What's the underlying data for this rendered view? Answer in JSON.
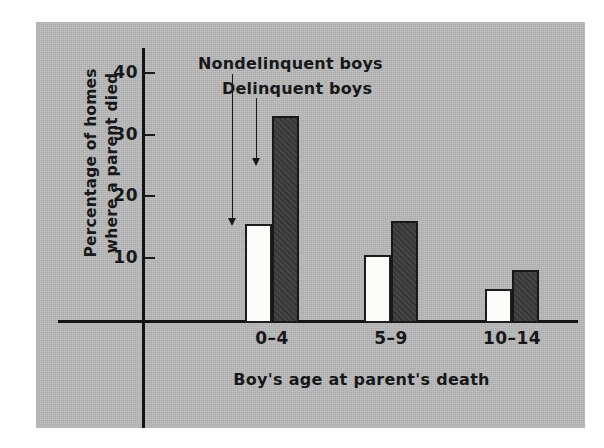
{
  "chart_data": {
    "type": "bar",
    "title": "",
    "xlabel": "Boy's age at parent's death",
    "ylabel_line1": "Percentage of homes",
    "ylabel_line2": "where a parent died",
    "categories": [
      "0–4",
      "5–9",
      "10–14"
    ],
    "series": [
      {
        "name": "Nondelinquent boys",
        "color": "#fbfbf8",
        "values": [
          16,
          11,
          5.5
        ]
      },
      {
        "name": "Delinquent boys",
        "color": "#3b3b3b",
        "values": [
          33.5,
          16.5,
          8.5
        ]
      }
    ],
    "ylim": [
      0,
      44
    ],
    "yticks": [
      10,
      20,
      30,
      40
    ],
    "ytick_labels": [
      "10",
      "20",
      "30",
      "40"
    ],
    "grid": false,
    "legend_position": "inline-annotations",
    "annotations": [
      {
        "text": "Nondelinquent boys",
        "points_to": "light bar of group 0–4"
      },
      {
        "text": "Delinquent boys",
        "points_to": "dark bar of group 0–4"
      }
    ]
  },
  "axis": {
    "ytick_labels": [
      "40",
      "30",
      "20",
      "10"
    ],
    "category_labels": [
      "0–4",
      "5–9",
      "10–14"
    ]
  },
  "labels": {
    "ylabel_line1": "Percentage of homes",
    "ylabel_line2": "where a parent died",
    "xlabel": "Boy's age at parent's death",
    "annot_nondelinquent": "Nondelinquent boys",
    "annot_delinquent": "Delinquent boys"
  },
  "colors": {
    "plate_background": "#b9b9b9",
    "ink": "#16181a",
    "bar_light": "#fbfbf8",
    "bar_dark": "#3b3b3b"
  }
}
